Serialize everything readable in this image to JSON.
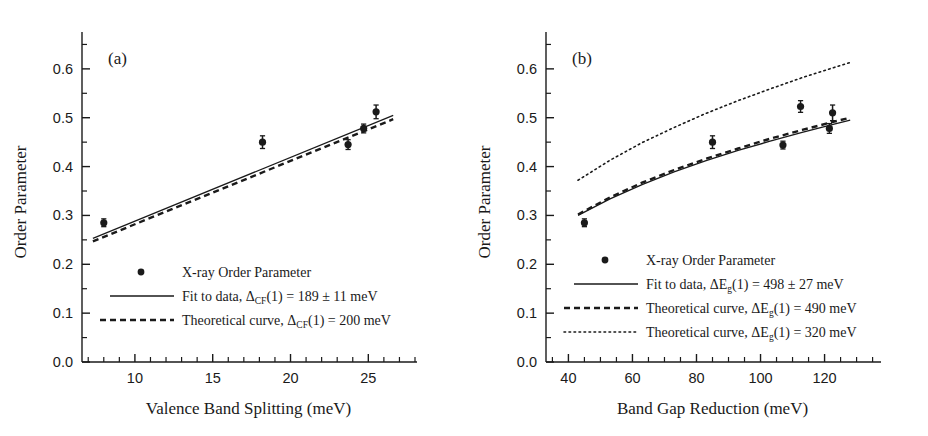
{
  "figure": {
    "background": "#ffffff",
    "ink": "#1a1a1a"
  },
  "chart_data": [
    {
      "type": "scatter",
      "panel_label": "(a)",
      "title": "",
      "xlabel": "Valence Band Splitting (meV)",
      "ylabel": "Order Parameter",
      "xlim": [
        6.6,
        28.0
      ],
      "ylim": [
        0.0,
        0.655
      ],
      "xticks": [
        10,
        15,
        20,
        25
      ],
      "xtick_labels": [
        "10",
        "15",
        "20",
        "25"
      ],
      "xminor_step": 1,
      "yticks": [
        0.0,
        0.1,
        0.2,
        0.3,
        0.4,
        0.5,
        0.6
      ],
      "ytick_labels": [
        "0.0",
        "0.1",
        "0.2",
        "0.3",
        "0.4",
        "0.5",
        "0.6"
      ],
      "yminor_step": 0.05,
      "grid": false,
      "legend_position": "lower-center",
      "series": [
        {
          "name": "X-ray Order Parameter",
          "style": "points",
          "marker": "filled-circle",
          "x": [
            8.0,
            18.2,
            23.7,
            24.7,
            25.5
          ],
          "y": [
            0.285,
            0.45,
            0.445,
            0.478,
            0.512
          ],
          "yerr": [
            0.008,
            0.013,
            0.01,
            0.009,
            0.014
          ]
        },
        {
          "name": "Fit to data, ΔCF(1) = 189 ± 11 meV",
          "style": "solid-line",
          "x": [
            7.3,
            26.6
          ],
          "y": [
            0.253,
            0.505
          ]
        },
        {
          "name": "Theoretical curve, ΔCF(1) = 200 meV",
          "style": "dashed-line",
          "x": [
            7.3,
            26.6
          ],
          "y": [
            0.247,
            0.497
          ]
        }
      ],
      "legend": [
        {
          "marker": "filled-circle",
          "text_parts": [
            {
              "t": "X-ray Order Parameter",
              "sub": false
            }
          ],
          "label": "X-ray Order Parameter"
        },
        {
          "marker": "solid-line",
          "text_parts": [
            {
              "t": "Fit to data, Δ",
              "sub": false
            },
            {
              "t": "CF",
              "sub": true
            },
            {
              "t": "(1) = 189 ± 11 meV",
              "sub": false
            }
          ],
          "label": "Fit to data, ΔCF(1) = 189 ± 11 meV"
        },
        {
          "marker": "dashed-line",
          "text_parts": [
            {
              "t": "Theoretical curve, Δ",
              "sub": false
            },
            {
              "t": "CF",
              "sub": true
            },
            {
              "t": "(1) = 200 meV",
              "sub": false
            }
          ],
          "label": "Theoretical curve, ΔCF(1) = 200 meV"
        }
      ]
    },
    {
      "type": "scatter",
      "panel_label": "(b)",
      "title": "",
      "xlabel": "Band Gap Reduction (meV)",
      "ylabel": "Order Parameter",
      "xlim": [
        33.0,
        137.0
      ],
      "ylim": [
        0.0,
        0.655
      ],
      "xticks": [
        40,
        60,
        80,
        100,
        120
      ],
      "xtick_labels": [
        "40",
        "60",
        "80",
        "100",
        "120"
      ],
      "xminor_step": 5,
      "yticks": [
        0.0,
        0.1,
        0.2,
        0.3,
        0.4,
        0.5,
        0.6
      ],
      "ytick_labels": [
        "0.0",
        "0.1",
        "0.2",
        "0.3",
        "0.4",
        "0.5",
        "0.6"
      ],
      "yminor_step": 0.05,
      "grid": false,
      "legend_position": "lower-center",
      "series": [
        {
          "name": "X-ray Order Parameter",
          "style": "points",
          "marker": "filled-circle",
          "x": [
            45.0,
            85.0,
            107.0,
            112.5,
            121.5,
            122.5
          ],
          "y": [
            0.285,
            0.45,
            0.444,
            0.523,
            0.478,
            0.51
          ],
          "yerr": [
            0.008,
            0.013,
            0.008,
            0.012,
            0.01,
            0.016
          ]
        },
        {
          "name": "Fit to data, ΔEg(1) = 498 ± 27 meV",
          "style": "solid-line",
          "x": [
            43,
            53,
            63,
            73,
            83,
            93,
            103,
            113,
            123,
            128
          ],
          "y": [
            0.3,
            0.334,
            0.363,
            0.389,
            0.412,
            0.433,
            0.452,
            0.47,
            0.487,
            0.495
          ]
        },
        {
          "name": "Theoretical curve, ΔEg(1) = 490 meV",
          "style": "dashed-line",
          "x": [
            43,
            53,
            63,
            73,
            83,
            93,
            103,
            113,
            123,
            128
          ],
          "y": [
            0.302,
            0.337,
            0.367,
            0.393,
            0.416,
            0.437,
            0.457,
            0.475,
            0.492,
            0.5
          ]
        },
        {
          "name": "Theoretical curve, ΔEg(1) = 320 meV",
          "style": "dotted-line",
          "x": [
            43,
            53,
            63,
            73,
            83,
            93,
            103,
            113,
            123,
            128
          ],
          "y": [
            0.372,
            0.413,
            0.449,
            0.48,
            0.509,
            0.535,
            0.559,
            0.582,
            0.603,
            0.613
          ]
        }
      ],
      "legend": [
        {
          "marker": "filled-circle",
          "text_parts": [
            {
              "t": "X-ray Order Parameter",
              "sub": false
            }
          ],
          "label": "X-ray Order Parameter"
        },
        {
          "marker": "solid-line",
          "text_parts": [
            {
              "t": "Fit to data, ΔE",
              "sub": false
            },
            {
              "t": "g",
              "sub": true
            },
            {
              "t": "(1) = 498 ± 27 meV",
              "sub": false
            }
          ],
          "label": "Fit to data, ΔEg(1) = 498 ± 27 meV"
        },
        {
          "marker": "dashed-line",
          "text_parts": [
            {
              "t": "Theoretical curve, ΔE",
              "sub": false
            },
            {
              "t": "g",
              "sub": true
            },
            {
              "t": "(1) = 490 meV",
              "sub": false
            }
          ],
          "label": "Theoretical curve, ΔEg(1) = 490 meV"
        },
        {
          "marker": "dotted-line",
          "text_parts": [
            {
              "t": "Theoretical curve, ΔE",
              "sub": false
            },
            {
              "t": "g",
              "sub": true
            },
            {
              "t": "(1) = 320 meV",
              "sub": false
            }
          ],
          "label": "Theoretical curve, ΔEg(1) = 320 meV"
        }
      ]
    }
  ]
}
